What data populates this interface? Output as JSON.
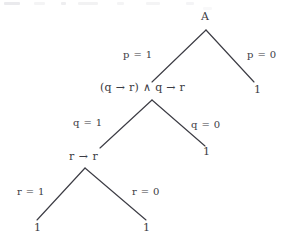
{
  "figure": {
    "type": "binary-decision-tree",
    "background_color": "#ffffff",
    "ink_color": "#3c3c44",
    "width": 288,
    "height": 248
  },
  "nodes": {
    "root": {
      "label": "A",
      "x": 206,
      "y": 18
    },
    "level2": {
      "label": "(q → r) ∧ q → r",
      "x": 145,
      "y": 88
    },
    "level3": {
      "label": "r → r",
      "x": 86,
      "y": 157
    }
  },
  "leaves": [
    {
      "label": "1",
      "x": 257,
      "y": 90
    },
    {
      "label": "1",
      "x": 206,
      "y": 152
    },
    {
      "label": "1",
      "x": 37,
      "y": 228
    },
    {
      "label": "1",
      "x": 146,
      "y": 228
    }
  ],
  "edge_labels": {
    "p_true": "p = 1",
    "p_false": "p = 0",
    "q_true": "q = 1",
    "q_false": "q = 0",
    "r_true": "r = 1",
    "r_false": "r = 0"
  },
  "edges": [
    {
      "name": "root-left",
      "from": [
        206,
        30
      ],
      "to": [
        152,
        82
      ],
      "label": "p = 1"
    },
    {
      "name": "root-right",
      "from": [
        206,
        30
      ],
      "to": [
        254,
        82
      ],
      "label": "p = 0"
    },
    {
      "name": "lvl2-left",
      "from": [
        152,
        100
      ],
      "to": [
        100,
        148
      ],
      "label": "q = 1"
    },
    {
      "name": "lvl2-right",
      "from": [
        152,
        100
      ],
      "to": [
        205,
        146
      ],
      "label": "q = 0"
    },
    {
      "name": "lvl3-left",
      "from": [
        85,
        168
      ],
      "to": [
        37,
        220
      ],
      "label": "r = 1"
    },
    {
      "name": "lvl3-right",
      "from": [
        85,
        168
      ],
      "to": [
        146,
        220
      ],
      "label": "r = 0"
    }
  ]
}
